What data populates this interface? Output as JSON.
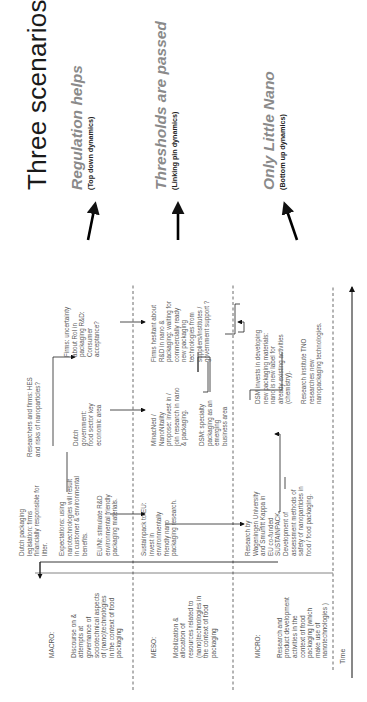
{
  "title": "Three scenarios",
  "scenarios": [
    {
      "name": "Regulation helps",
      "dynamics": "(Top down dynamics)"
    },
    {
      "name": "Thresholds are passed",
      "dynamics": "(Linking pin dynamics)"
    },
    {
      "name": "Only Little Nano",
      "dynamics": "(Bottom up dynamics)"
    }
  ],
  "levels": {
    "macro": {
      "label": "MACRO:",
      "description": "Discourse on &\nattempts at\ngovernance of\nsociotechnical aspects\nof (nano)technologies\nin the context of food\npackaging"
    },
    "meso": {
      "label": "MESO:",
      "description": "Mobilization &\nallocation of\nresources related to\n(nano)technologies in\nthe context of food\npackaging"
    },
    "micro": {
      "label": "MICRO:",
      "description": "Research and\nproduct development\nactivities in the\ncontext of food\npackaging (which\nmake use of\nnanotechnologies )"
    }
  },
  "events": {
    "dutch_legislation": "Dutch packaging\nlegislation: firms\nfinancially responsible for\nlitter.",
    "expectations": "Expectations: using\nnanotechnologies will result\nin customer & environmental\nbenefits.",
    "eu_nl": "EU/NI: stimulate R&D\nenvironmental friendly\npackaging materials.",
    "researchers_hes": "Researchers and firms: HES\nand risks of nanoparticles?",
    "dutch_government": "Dutch\ngovernment:\nfood sector key\neconomic area",
    "firms_roi": "Firms: uncertainty\nabout RoI in\npackaging R&D:\nConsumer\nacceptance?",
    "sustainpack": "Sustainpack to EU:\ninvest in\nenvironmentally\nfriendly nano\npackaging research.",
    "minacned": "MinacNed /\nNanoNitality\npropose: invest in /\njoin research in nano\n& packaging.",
    "dsm_specialty": "DSM: specialty\npackaging as an\nemerging\nbusiness area",
    "firms_hesitant": "Firms hesitant about\nR&D in nano &\npackaging: waiting for\ncommercially ready\nnew packaging\ntechnologies from\nsuppliers/institutes /\ngovernment support ?",
    "wageningen": "Research by\nWageningen University\nand Smurfitt Kappa in\nEU co-funded\nSUSTAINPACK.\nDevelopment of\nassessment methods of\nsafety of nanoparticles in\nfood / food packaging.",
    "dsm_invests": "DSM invests in developing\nnew packaging materials:\nnano is new label for\nalready existing activities\n(chemistry).",
    "tno": "Research institute TNO\nresearches new\nnanopackaging technologies."
  },
  "axis": {
    "time_label": "Time"
  },
  "colors": {
    "title": "#1a1a1a",
    "scenario": "#8a8a8a",
    "subtitle": "#222222",
    "body_text": "#5a5a5a",
    "lines": "#333333"
  }
}
